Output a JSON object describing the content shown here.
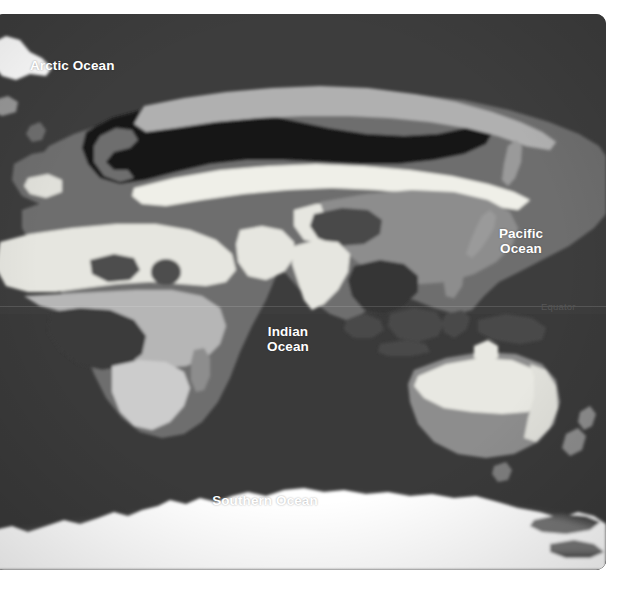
{
  "map": {
    "title": "World biome map (Eastern Hemisphere)",
    "projection_note": "equirectangular, Eastern Hemisphere centred",
    "ocean_labels": [
      {
        "id": "arctic",
        "name": "Arctic Ocean",
        "text": "Arctic Ocean"
      },
      {
        "id": "pacific",
        "name": "Pacific Ocean",
        "text": "Pacific\nOcean"
      },
      {
        "id": "indian",
        "name": "Indian Ocean",
        "text": "Indian\nOcean"
      },
      {
        "id": "southern",
        "name": "Southern Ocean",
        "text": "Southern Ocean"
      }
    ],
    "graticule_labels": [
      {
        "id": "equator",
        "text": "Equator"
      }
    ],
    "colors": {
      "page_background": "#ffffff",
      "panel_border": "#ffffff",
      "ocean": "#3d3d3d",
      "ocean_deep": "#333333",
      "zone_black": "#121212",
      "zone_dark": "#2e2e2e",
      "zone_mid_dark": "#4a4a4a",
      "zone_mid": "#6b6b6b",
      "zone_mid_light": "#8a8a8a",
      "zone_light": "#a8a8a8",
      "zone_pale": "#c9c9c9",
      "zone_cream": "#e8e8e3",
      "ice": "#ffffff",
      "label_text": "#ffffff",
      "equator_text": "#555555"
    }
  }
}
